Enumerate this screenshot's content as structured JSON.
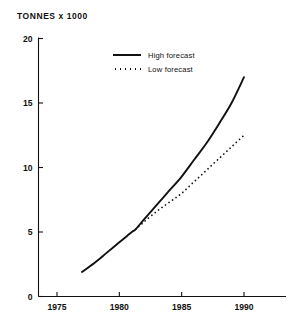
{
  "chart_data": {
    "type": "line",
    "title": "TONNES x 1000",
    "xlabel": "",
    "ylabel": "TONNES x 1000",
    "xlim": [
      1973.5,
      1993
    ],
    "ylim": [
      0,
      20
    ],
    "xticks": [
      1975,
      1980,
      1985,
      1990
    ],
    "xtick_labels": [
      "1975",
      "1980",
      "1985",
      "1990"
    ],
    "yticks": [
      0,
      5,
      10,
      15,
      20
    ],
    "ytick_labels": [
      "0",
      "5",
      "10",
      "15",
      "20"
    ],
    "grid": false,
    "legend_position": "upper-center",
    "series": [
      {
        "name": "High forecast",
        "style": "solid",
        "color": "#111111",
        "x": [
          1977,
          1978,
          1979,
          1980,
          1981,
          1981.3,
          1982,
          1983,
          1984,
          1985,
          1986,
          1987,
          1988,
          1989,
          1990
        ],
        "values": [
          1.9,
          2.6,
          3.4,
          4.2,
          5.0,
          5.2,
          6.0,
          7.1,
          8.2,
          9.3,
          10.6,
          11.9,
          13.4,
          15.0,
          17.0
        ]
      },
      {
        "name": "Low forecast",
        "style": "dotted",
        "color": "#111111",
        "x": [
          1981.3,
          1982,
          1983,
          1984,
          1985,
          1986,
          1987,
          1988,
          1989,
          1990
        ],
        "values": [
          5.2,
          5.8,
          6.6,
          7.3,
          8.0,
          8.9,
          9.8,
          10.7,
          11.6,
          12.5
        ]
      }
    ],
    "legend": [
      {
        "label": "High forecast",
        "style": "solid"
      },
      {
        "label": "Low forecast",
        "style": "dotted"
      }
    ]
  }
}
